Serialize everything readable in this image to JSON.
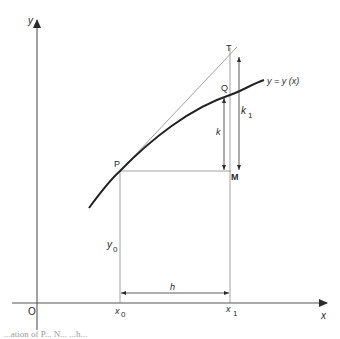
{
  "diagram": {
    "axes": {
      "x_label": "x",
      "y_label": "y",
      "origin_label": "O"
    },
    "points": {
      "P": "P",
      "Q": "Q",
      "T": "T",
      "M": "M"
    },
    "curve_label": "y = y (x)",
    "labels": {
      "x0": "x",
      "x0_sub": "0",
      "x1": "x",
      "x1_sub": "1",
      "y0": "y",
      "y0_sub": "0",
      "h": "h",
      "k": "k",
      "k1": "k",
      "k1_sub": "1"
    },
    "caption_fragment": "...ation of P...    N...    ...h..."
  },
  "colors": {
    "ink": "#2a2a2a",
    "thin_line": "#8a8a8a",
    "background": "#ffffff"
  }
}
